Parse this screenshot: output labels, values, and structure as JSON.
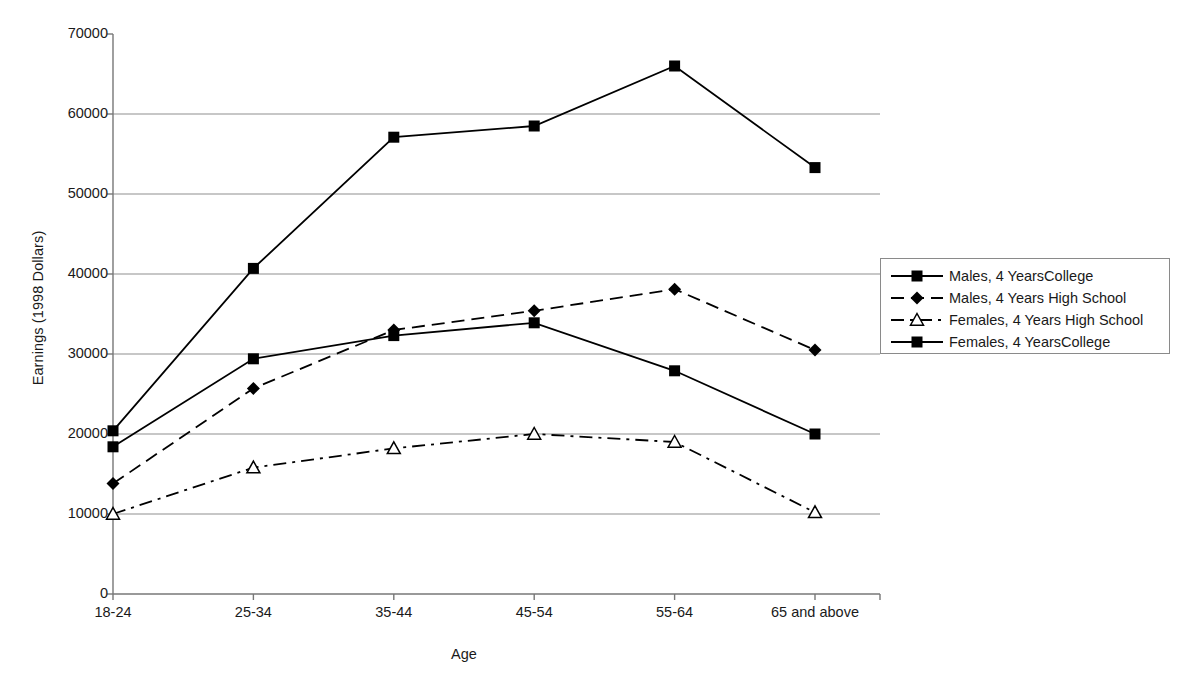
{
  "chart_data": {
    "type": "line",
    "title": "",
    "xlabel": "Age",
    "ylabel": "Earnings (1998 Dollars)",
    "categories": [
      "18-24",
      "25-34",
      "35-44",
      "45-54",
      "55-64",
      "65 and above"
    ],
    "ylim": [
      0,
      70000
    ],
    "ytick_labels": [
      "0",
      "10000",
      "20000",
      "30000",
      "40000",
      "50000",
      "60000",
      "70000"
    ],
    "ytick_values": [
      0,
      10000,
      20000,
      30000,
      40000,
      50000,
      60000,
      70000
    ],
    "grid": "horizontal",
    "legend_position": "right",
    "series": [
      {
        "name": "Males, 4 YearsCollege",
        "marker": "filled-square",
        "line": "solid",
        "color": "#000000",
        "values": [
          20400,
          40700,
          57100,
          58500,
          66000,
          53300
        ]
      },
      {
        "name": "Males, 4 Years High School",
        "marker": "filled-diamond",
        "line": "dashed",
        "color": "#000000",
        "values": [
          13800,
          25700,
          33000,
          35400,
          38100,
          30500
        ]
      },
      {
        "name": "Females, 4 Years High School",
        "marker": "open-triangle",
        "line": "dash-dot",
        "color": "#000000",
        "values": [
          10000,
          15800,
          18200,
          20000,
          19000,
          10200
        ]
      },
      {
        "name": "Females, 4 YearsCollege",
        "marker": "filled-square",
        "line": "solid",
        "color": "#000000",
        "values": [
          18400,
          29400,
          32300,
          33900,
          27900,
          20000
        ]
      }
    ]
  }
}
